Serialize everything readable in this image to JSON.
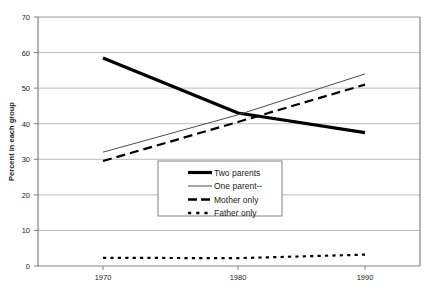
{
  "chart_data": {
    "type": "line",
    "title": "",
    "xlabel": "",
    "ylabel": "Percent in each group",
    "x": [
      1970,
      1980,
      1990
    ],
    "categories": [
      "1970",
      "1980",
      "1990"
    ],
    "xtick_labels": [
      "1970",
      "1980",
      "1990"
    ],
    "ytick_labels": [
      "0",
      "10",
      "20",
      "30",
      "40",
      "50",
      "60",
      "70"
    ],
    "ytick_values": [
      0,
      10,
      20,
      30,
      40,
      50,
      60,
      70
    ],
    "ylim": [
      0,
      70
    ],
    "xlim": [
      1968,
      1992
    ],
    "grid": "horizontal",
    "legend_position": "center",
    "series": [
      {
        "name": "Two parents",
        "style": "solid-thick",
        "color": "#000000",
        "values": [
          58.5,
          43.0,
          37.5
        ]
      },
      {
        "name": "One parent--",
        "style": "solid-thin",
        "color": "#444444",
        "values": [
          32.0,
          42.5,
          54.0
        ]
      },
      {
        "name": "Mother only",
        "style": "dashed",
        "color": "#000000",
        "values": [
          29.5,
          40.5,
          51.0
        ]
      },
      {
        "name": "Father only",
        "style": "dotted",
        "color": "#000000",
        "values": [
          2.3,
          2.2,
          3.2
        ]
      }
    ]
  },
  "legend": {
    "items": [
      {
        "label": "Two parents",
        "swatch": "legend-swatch-solid-thick"
      },
      {
        "label": "One parent--",
        "swatch": "legend-swatch-solid-thin"
      },
      {
        "label": "Mother only",
        "swatch": "legend-swatch-dashed"
      },
      {
        "label": "Father only",
        "swatch": "legend-swatch-dotted"
      }
    ]
  },
  "axes": {
    "y_title": "Percent in each group",
    "y_ticks": [
      "70",
      "60",
      "50",
      "40",
      "30",
      "20",
      "10",
      "0"
    ],
    "x_ticks": [
      "1970",
      "1980",
      "1990"
    ]
  },
  "colors": {
    "plot_border": "#999999",
    "gridline": "#bbbbbb",
    "background": "#ffffff",
    "text": "#1a1a1a",
    "series_primary": "#000000",
    "series_secondary": "#444444"
  }
}
